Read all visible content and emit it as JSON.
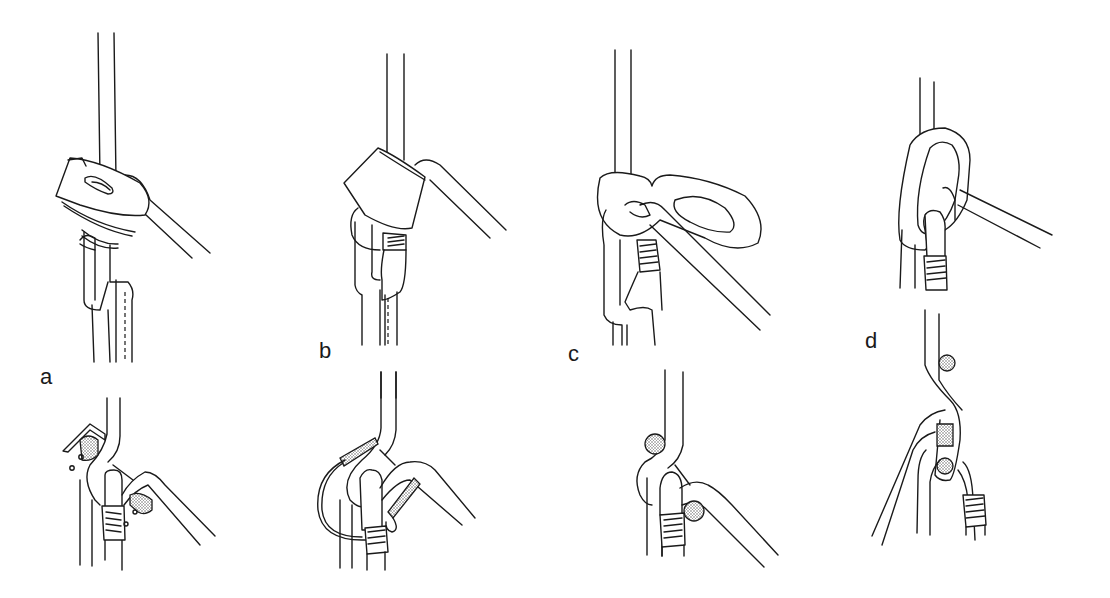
{
  "figure": {
    "panels": [
      {
        "id": "a",
        "label": "a",
        "device": "Sticht-type belay plate"
      },
      {
        "id": "b",
        "label": "b",
        "device": "Tubular belay device"
      },
      {
        "id": "c",
        "label": "c",
        "device": "Figure-eight-style plate"
      },
      {
        "id": "d",
        "label": "d",
        "device": "Carabiner Munter/crab friction"
      }
    ],
    "colors": {
      "line": "#1a1a1a",
      "background": "#ffffff",
      "stipple": "#9a9a9a"
    }
  }
}
